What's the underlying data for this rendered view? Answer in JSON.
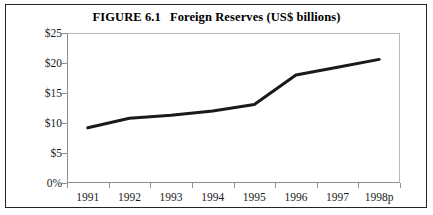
{
  "figure": {
    "number": "FIGURE 6.1",
    "title": "Foreign Reserves (US$ billions)"
  },
  "chart_data": {
    "type": "line",
    "xlabel": "",
    "ylabel": "",
    "categories": [
      "1991",
      "1992",
      "1993",
      "1994",
      "1995",
      "1996",
      "1997",
      "1998p"
    ],
    "values": [
      9.2,
      10.8,
      11.3,
      12.0,
      13.1,
      18.0,
      19.3,
      20.6
    ],
    "series": [
      {
        "name": "Foreign Reserves",
        "values": [
          9.2,
          10.8,
          11.3,
          12.0,
          13.1,
          18.0,
          19.3,
          20.6
        ]
      }
    ],
    "ylim": [
      0,
      25
    ],
    "yticks": [
      0,
      5,
      10,
      15,
      20,
      25
    ],
    "ytick_labels": [
      "0%",
      "$5",
      "$10",
      "$15",
      "$20",
      "$25"
    ],
    "xtick_labels": [
      "1991",
      "1992",
      "1993",
      "1994",
      "1995",
      "1996",
      "1997",
      "1998p"
    ],
    "grid": false,
    "legend": "none",
    "line_color": "#1a1a1a",
    "line_width": 3
  }
}
